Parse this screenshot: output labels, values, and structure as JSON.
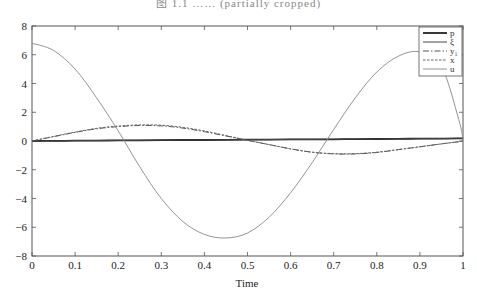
{
  "caption": "图 1.1  …… (partially cropped)",
  "chart_data": {
    "type": "line",
    "title": "",
    "xlabel": "Time",
    "ylabel": "",
    "xlim": [
      0,
      1
    ],
    "ylim": [
      -8,
      8
    ],
    "xticks": [
      "0",
      "0.1",
      "0.2",
      "0.3",
      "0.4",
      "0.5",
      "0.6",
      "0.7",
      "0.8",
      "0.9",
      "1"
    ],
    "yticks": [
      "8",
      "6",
      "4",
      "2",
      "0",
      "−2",
      "−4",
      "−6",
      "−8"
    ],
    "grid": false,
    "legend_position": "upper right",
    "x": [
      0,
      0.05,
      0.1,
      0.15,
      0.2,
      0.25,
      0.3,
      0.35,
      0.4,
      0.45,
      0.5,
      0.55,
      0.6,
      0.65,
      0.7,
      0.75,
      0.8,
      0.85,
      0.9,
      0.95,
      0.99,
      1.0
    ],
    "series": [
      {
        "name": "p",
        "style": "solid-thick",
        "color": "#222222",
        "values": [
          0,
          0.01,
          0.02,
          0.03,
          0.04,
          0.05,
          0.06,
          0.07,
          0.07,
          0.08,
          0.09,
          0.1,
          0.11,
          0.11,
          0.12,
          0.13,
          0.14,
          0.15,
          0.16,
          0.17,
          0.18,
          0.18
        ]
      },
      {
        "name": "ξ",
        "style": "solid",
        "color": "#444444",
        "values": [
          0,
          0.01,
          0.02,
          0.03,
          0.04,
          0.05,
          0.06,
          0.07,
          0.07,
          0.08,
          0.09,
          0.1,
          0.11,
          0.11,
          0.12,
          0.13,
          0.14,
          0.15,
          0.16,
          0.17,
          0.18,
          0.18
        ]
      },
      {
        "name": "y₁",
        "style": "dash-dot",
        "color": "#555555",
        "values": [
          0,
          0.3,
          0.6,
          0.85,
          1.0,
          1.08,
          1.05,
          0.9,
          0.65,
          0.35,
          0.05,
          -0.25,
          -0.55,
          -0.78,
          -0.9,
          -0.9,
          -0.8,
          -0.6,
          -0.4,
          -0.2,
          -0.05,
          0
        ]
      },
      {
        "name": "x",
        "style": "dashed",
        "color": "#666666",
        "values": [
          0,
          0.32,
          0.62,
          0.88,
          1.04,
          1.12,
          1.1,
          0.95,
          0.7,
          0.38,
          0.05,
          -0.25,
          -0.55,
          -0.78,
          -0.88,
          -0.88,
          -0.78,
          -0.6,
          -0.4,
          -0.2,
          -0.05,
          0
        ]
      },
      {
        "name": "u",
        "style": "solid-thin",
        "color": "#888888",
        "values": [
          6.8,
          6.3,
          5.0,
          3.0,
          0.7,
          -1.8,
          -4.0,
          -5.6,
          -6.5,
          -6.75,
          -6.4,
          -5.3,
          -3.6,
          -1.5,
          0.8,
          3.0,
          4.8,
          5.9,
          6.2,
          5.2,
          1.5,
          0.1
        ]
      }
    ]
  }
}
